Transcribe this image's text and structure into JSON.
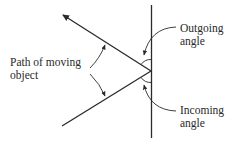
{
  "diagram": {
    "labels": {
      "path": [
        "Path of moving",
        "object"
      ],
      "outgoing": [
        "Outgoing",
        "angle"
      ],
      "incoming": [
        "Incoming",
        "angle"
      ]
    },
    "colors": {
      "stroke": "#2a2a2a",
      "background": "#ffffff"
    }
  }
}
